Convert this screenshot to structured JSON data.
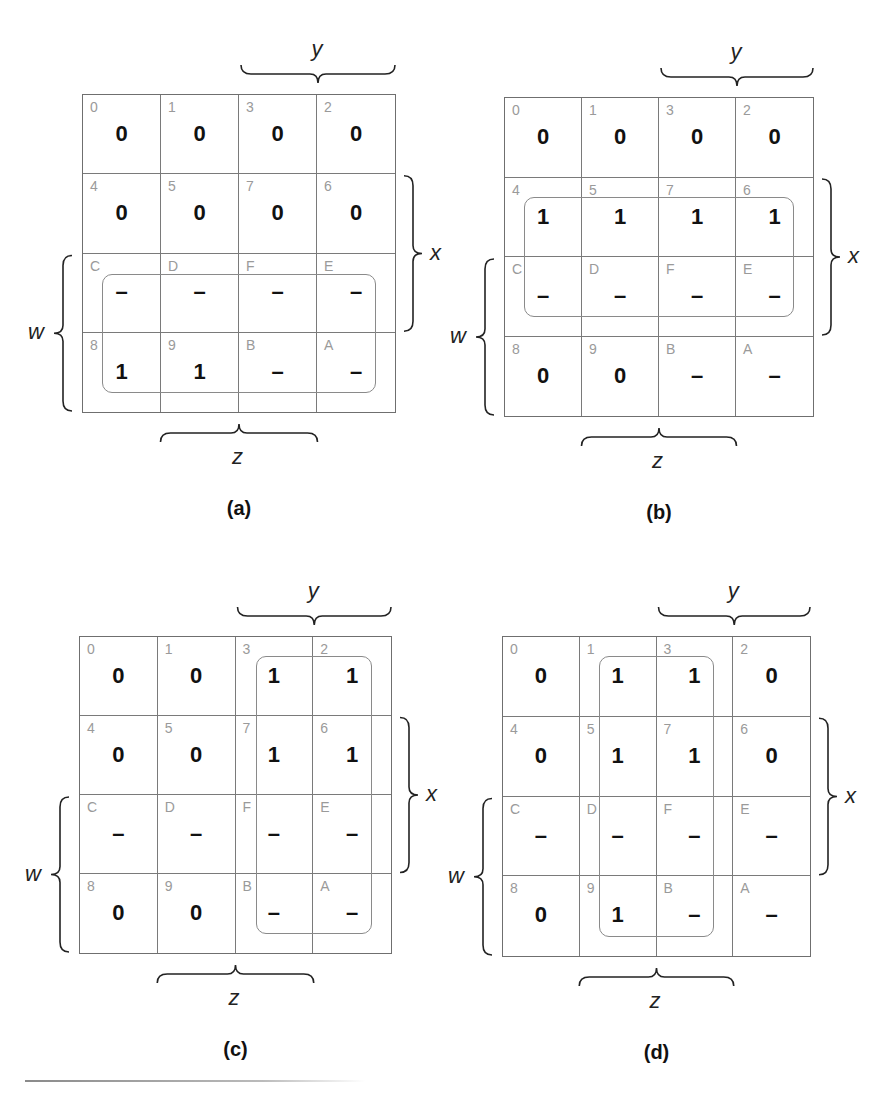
{
  "figure": {
    "maps": [
      {
        "id": "a",
        "caption": "(a)",
        "cells": [
          [
            {
              "idx": "0",
              "val": "0"
            },
            {
              "idx": "1",
              "val": "0"
            },
            {
              "idx": "3",
              "val": "0"
            },
            {
              "idx": "2",
              "val": "0"
            }
          ],
          [
            {
              "idx": "4",
              "val": "0"
            },
            {
              "idx": "5",
              "val": "0"
            },
            {
              "idx": "7",
              "val": "0"
            },
            {
              "idx": "6",
              "val": "0"
            }
          ],
          [
            {
              "idx": "C",
              "val": "–"
            },
            {
              "idx": "D",
              "val": "–"
            },
            {
              "idx": "F",
              "val": "–"
            },
            {
              "idx": "E",
              "val": "–"
            }
          ],
          [
            {
              "idx": "8",
              "val": "1"
            },
            {
              "idx": "9",
              "val": "1"
            },
            {
              "idx": "B",
              "val": "–"
            },
            {
              "idx": "A",
              "val": "–"
            }
          ]
        ],
        "loop": {
          "rows": [
            2,
            3
          ],
          "cols": [
            0,
            3
          ]
        }
      },
      {
        "id": "b",
        "caption": "(b)",
        "cells": [
          [
            {
              "idx": "0",
              "val": "0"
            },
            {
              "idx": "1",
              "val": "0"
            },
            {
              "idx": "3",
              "val": "0"
            },
            {
              "idx": "2",
              "val": "0"
            }
          ],
          [
            {
              "idx": "4",
              "val": "1"
            },
            {
              "idx": "5",
              "val": "1"
            },
            {
              "idx": "7",
              "val": "1"
            },
            {
              "idx": "6",
              "val": "1"
            }
          ],
          [
            {
              "idx": "C",
              "val": "–"
            },
            {
              "idx": "D",
              "val": "–"
            },
            {
              "idx": "F",
              "val": "–"
            },
            {
              "idx": "E",
              "val": "–"
            }
          ],
          [
            {
              "idx": "8",
              "val": "0"
            },
            {
              "idx": "9",
              "val": "0"
            },
            {
              "idx": "B",
              "val": "–"
            },
            {
              "idx": "A",
              "val": "–"
            }
          ]
        ],
        "loop": {
          "rows": [
            1,
            2
          ],
          "cols": [
            0,
            3
          ]
        }
      },
      {
        "id": "c",
        "caption": "(c)",
        "cells": [
          [
            {
              "idx": "0",
              "val": "0"
            },
            {
              "idx": "1",
              "val": "0"
            },
            {
              "idx": "3",
              "val": "1"
            },
            {
              "idx": "2",
              "val": "1"
            }
          ],
          [
            {
              "idx": "4",
              "val": "0"
            },
            {
              "idx": "5",
              "val": "0"
            },
            {
              "idx": "7",
              "val": "1"
            },
            {
              "idx": "6",
              "val": "1"
            }
          ],
          [
            {
              "idx": "C",
              "val": "–"
            },
            {
              "idx": "D",
              "val": "–"
            },
            {
              "idx": "F",
              "val": "–"
            },
            {
              "idx": "E",
              "val": "–"
            }
          ],
          [
            {
              "idx": "8",
              "val": "0"
            },
            {
              "idx": "9",
              "val": "0"
            },
            {
              "idx": "B",
              "val": "–"
            },
            {
              "idx": "A",
              "val": "–"
            }
          ]
        ],
        "loop": {
          "rows": [
            0,
            3
          ],
          "cols": [
            2,
            3
          ]
        }
      },
      {
        "id": "d",
        "caption": "(d)",
        "cells": [
          [
            {
              "idx": "0",
              "val": "0"
            },
            {
              "idx": "1",
              "val": "1"
            },
            {
              "idx": "3",
              "val": "1"
            },
            {
              "idx": "2",
              "val": "0"
            }
          ],
          [
            {
              "idx": "4",
              "val": "0"
            },
            {
              "idx": "5",
              "val": "1"
            },
            {
              "idx": "7",
              "val": "1"
            },
            {
              "idx": "6",
              "val": "0"
            }
          ],
          [
            {
              "idx": "C",
              "val": "–"
            },
            {
              "idx": "D",
              "val": "–"
            },
            {
              "idx": "F",
              "val": "–"
            },
            {
              "idx": "E",
              "val": "–"
            }
          ],
          [
            {
              "idx": "8",
              "val": "0"
            },
            {
              "idx": "9",
              "val": "1"
            },
            {
              "idx": "B",
              "val": "–"
            },
            {
              "idx": "A",
              "val": "–"
            }
          ]
        ],
        "loop": {
          "rows": [
            0,
            3
          ],
          "cols": [
            1,
            2
          ]
        }
      }
    ],
    "variable_labels": {
      "y": "y",
      "x": "x",
      "w": "w",
      "z": "z"
    }
  }
}
